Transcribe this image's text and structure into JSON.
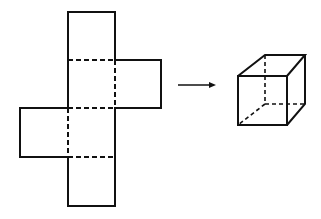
{
  "diagram": {
    "stroke_color": "#111111",
    "background": "#ffffff",
    "net": {
      "label": "Cross-shaped cube net",
      "faces": [
        {
          "name": "top-face",
          "x": 68,
          "y": 12,
          "w": 47,
          "h": 48
        },
        {
          "name": "upper-middle-face",
          "x": 68,
          "y": 60,
          "w": 47,
          "h": 48
        },
        {
          "name": "right-flap-face",
          "x": 115,
          "y": 60,
          "w": 46,
          "h": 48
        },
        {
          "name": "lower-middle-face",
          "x": 68,
          "y": 108,
          "w": 47,
          "h": 49
        },
        {
          "name": "left-flap-face",
          "x": 20,
          "y": 108,
          "w": 48,
          "h": 49
        },
        {
          "name": "bottom-face",
          "x": 68,
          "y": 157,
          "w": 47,
          "h": 49
        }
      ],
      "fold_lines": "dashed"
    },
    "arrow": {
      "label": "folds into",
      "x1": 178,
      "y1": 85,
      "x2": 216,
      "y2": 85
    },
    "cube": {
      "label": "Resulting cube",
      "front": {
        "x": 238,
        "y": 76,
        "w": 49,
        "h": 49
      },
      "offset": {
        "dx": 27,
        "dy": -21
      },
      "hidden_edges": "dashed"
    }
  }
}
